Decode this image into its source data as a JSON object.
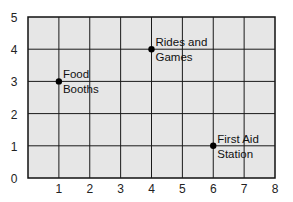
{
  "chart_data": {
    "type": "scatter",
    "title": "",
    "xlabel": "",
    "ylabel": "",
    "xlim": [
      0,
      8
    ],
    "ylim": [
      0,
      5
    ],
    "grid": true,
    "x_ticks": [
      "1",
      "2",
      "3",
      "4",
      "5",
      "6",
      "7",
      "8"
    ],
    "y_ticks": [
      "0",
      "1",
      "2",
      "3",
      "4",
      "5"
    ],
    "points": [
      {
        "x": 1,
        "y": 3,
        "label_line1": "Food",
        "label_line2": "Booths"
      },
      {
        "x": 4,
        "y": 4,
        "label_line1": "Rides and",
        "label_line2": "Games"
      },
      {
        "x": 6,
        "y": 1,
        "label_line1": "First Aid",
        "label_line2": "Station"
      }
    ],
    "colors": {
      "plot_bg": "#e6e6e6",
      "grid": "#1a1a1a",
      "point": "#000000"
    }
  }
}
